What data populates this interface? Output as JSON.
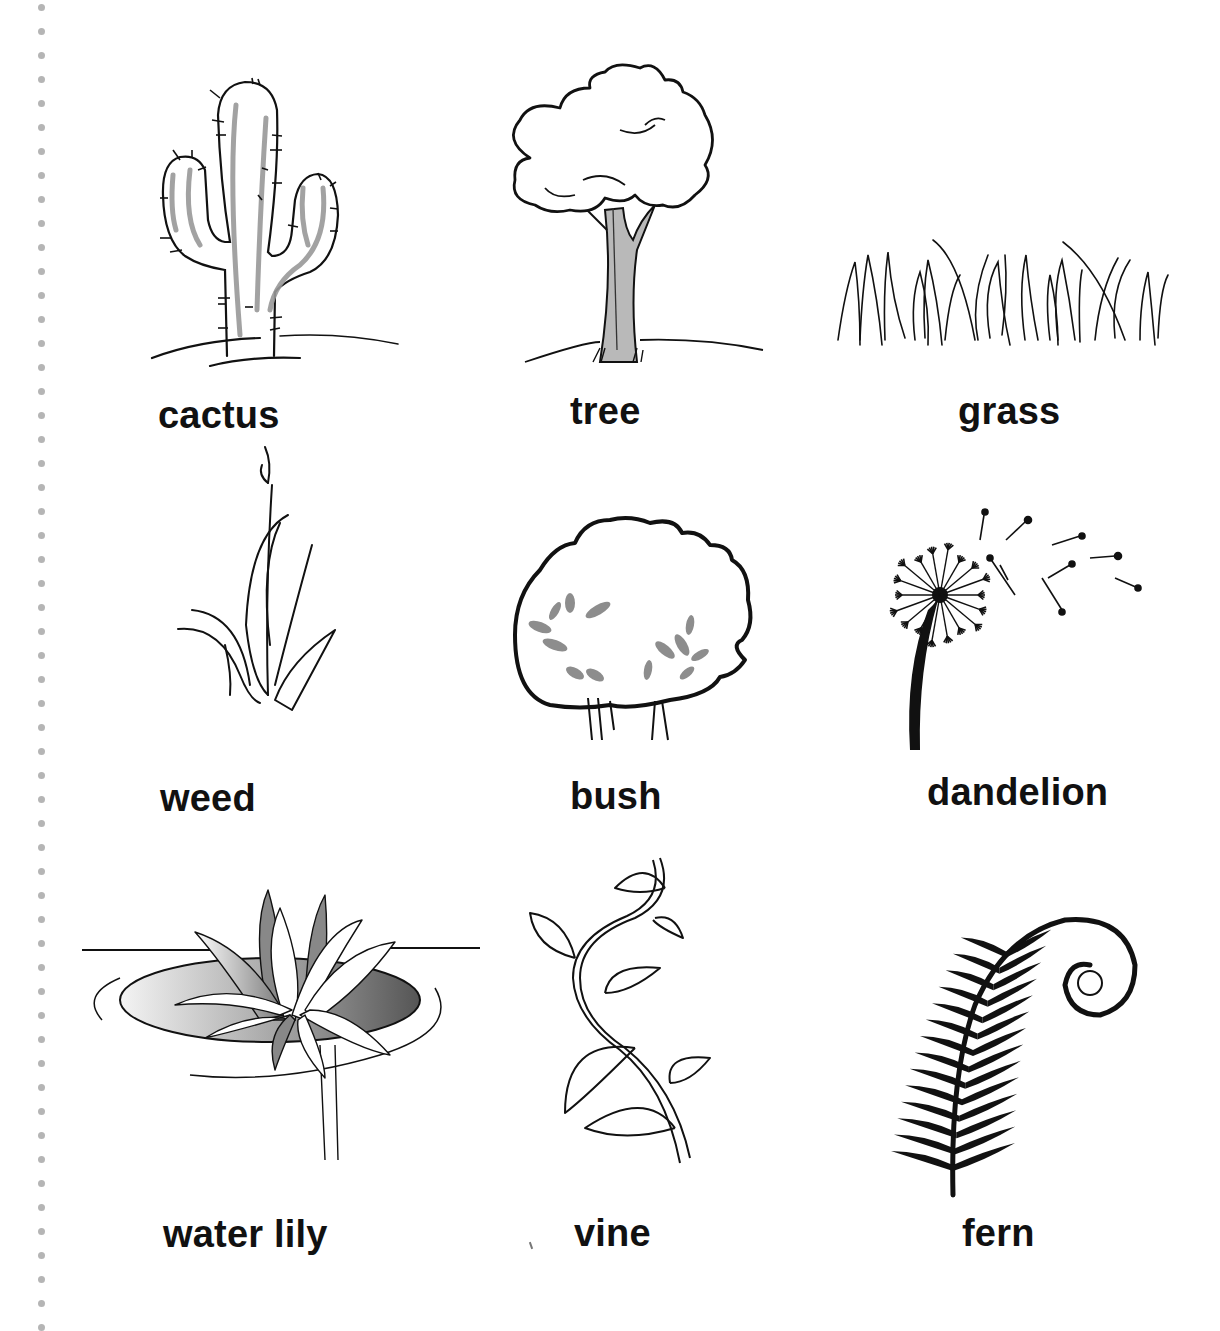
{
  "page": {
    "type": "vocabulary picture sheet",
    "theme_colors": {
      "ink": "#111111",
      "gray_fill": "#9a9a9a",
      "binder_dots": "#b5b5b5"
    }
  },
  "plants": [
    {
      "id": "cactus",
      "label": "cactus",
      "icon": "cactus-icon"
    },
    {
      "id": "tree",
      "label": "tree",
      "icon": "tree-icon"
    },
    {
      "id": "grass",
      "label": "grass",
      "icon": "grass-icon"
    },
    {
      "id": "weed",
      "label": "weed",
      "icon": "weed-icon"
    },
    {
      "id": "bush",
      "label": "bush",
      "icon": "bush-icon"
    },
    {
      "id": "dandelion",
      "label": "dandelion",
      "icon": "dandelion-icon"
    },
    {
      "id": "water-lily",
      "label": "water lily",
      "icon": "water-lily-icon"
    },
    {
      "id": "vine",
      "label": "vine",
      "icon": "vine-icon"
    },
    {
      "id": "fern",
      "label": "fern",
      "icon": "fern-icon"
    }
  ]
}
